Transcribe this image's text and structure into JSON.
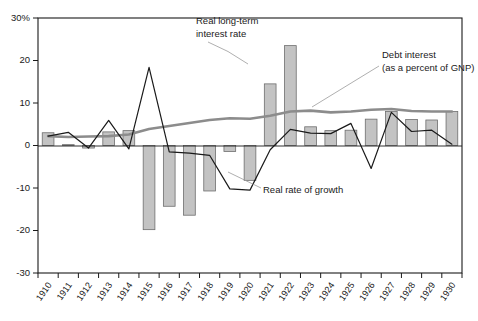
{
  "chart_data": {
    "type": "bar",
    "title": "",
    "subtitle": "",
    "xlabel": "",
    "ylabel": "",
    "ylim": [
      -30,
      30
    ],
    "yticks": [
      30,
      20,
      10,
      0,
      -10,
      -20,
      -30
    ],
    "ytick_labels": [
      "30%",
      "20",
      "10",
      "0",
      "-10",
      "-20",
      "-30"
    ],
    "grid": false,
    "legend_position": "annotations-inline",
    "categories": [
      "1910",
      "1911",
      "1912",
      "1913",
      "1914",
      "1915",
      "1916",
      "1917",
      "1918",
      "1919",
      "1920",
      "1921",
      "1922",
      "1923",
      "1924",
      "1925",
      "1926",
      "1927",
      "1928",
      "1929",
      "1930"
    ],
    "series": [
      {
        "name": "Real rate of growth",
        "type": "bar",
        "values": [
          3.0,
          0.2,
          -0.6,
          3.2,
          3.5,
          -19.8,
          -14.3,
          -16.4,
          -10.7,
          -1.4,
          -8.2,
          14.5,
          23.5,
          4.4,
          3.5,
          3.6,
          6.2,
          8.0,
          6.1,
          6.0,
          8.0
        ]
      },
      {
        "name": "Real long-term interest rate",
        "type": "line",
        "color": "#1a1a1a",
        "values": [
          2.2,
          3.1,
          -0.6,
          5.9,
          -0.8,
          18.4,
          -1.5,
          -1.8,
          -2.3,
          -10.2,
          -10.5,
          -1.0,
          3.8,
          2.9,
          2.8,
          5.2,
          -5.4,
          7.8,
          3.3,
          3.6,
          0.3
        ]
      },
      {
        "name": "Debt interest (as a percent of GNP)",
        "type": "line",
        "color": "#8c8c8c",
        "values": [
          2.2,
          2.0,
          2.1,
          2.2,
          2.6,
          3.9,
          4.6,
          5.3,
          6.0,
          6.4,
          6.3,
          7.0,
          8.0,
          8.2,
          7.8,
          8.0,
          8.4,
          8.6,
          8.1,
          8.0,
          8.0
        ]
      }
    ],
    "annotations": [
      {
        "id": "annot-interest-rate",
        "label_line1": "Real long-term",
        "label_line2": "interest rate",
        "points_to_series": "Real long-term interest rate"
      },
      {
        "id": "annot-debt-interest",
        "label_line1": "Debt interest",
        "label_line2": "(as a percent of GNP)",
        "points_to_series": "Debt interest (as a percent of GNP)"
      },
      {
        "id": "annot-growth",
        "label_line1": "Real rate of growth",
        "label_line2": "",
        "points_to_series": "Real rate of growth"
      }
    ]
  }
}
